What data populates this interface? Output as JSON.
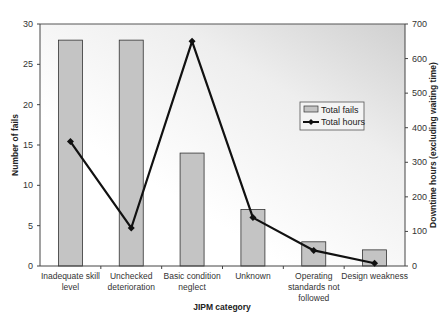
{
  "chart_data": {
    "type": "bar+line",
    "title": "",
    "xlabel": "JIPM category",
    "ylabel": "Number of fails",
    "y2label": "Downtime hours (excluding waiting time)",
    "categories": [
      [
        "Inadequate skill",
        "level"
      ],
      [
        "Unchecked",
        "deterioration"
      ],
      [
        "Basic condition",
        "neglect"
      ],
      [
        "Unknown"
      ],
      [
        "Operating",
        "standards not",
        "followed"
      ],
      [
        "Design  weakness"
      ]
    ],
    "series": [
      {
        "name": "Total fails",
        "type": "bar",
        "axis": "left",
        "values": [
          28,
          28,
          14,
          7,
          3,
          2
        ],
        "color": "#c4c4c4"
      },
      {
        "name": "Total hours",
        "type": "line",
        "axis": "right",
        "values": [
          360,
          110,
          650,
          140,
          45,
          8
        ],
        "color": "#111111"
      }
    ],
    "ylim": [
      0,
      30
    ],
    "yticks": [
      0,
      5,
      10,
      15,
      20,
      25,
      30
    ],
    "y2lim": [
      0,
      700
    ],
    "y2ticks": [
      0,
      100,
      200,
      300,
      400,
      500,
      600,
      700
    ],
    "legend": {
      "position": "inside-right",
      "entries": [
        "Total fails",
        "Total hours"
      ]
    },
    "grid": false
  }
}
